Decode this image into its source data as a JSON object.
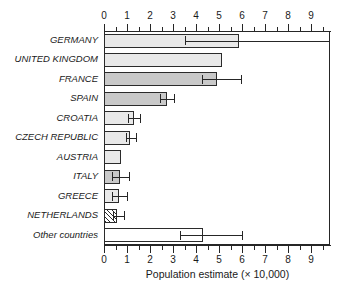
{
  "chart_data": {
    "type": "bar",
    "orientation": "horizontal",
    "title": "",
    "xlabel": "Population estimate (× 10,000)",
    "ylabel": "",
    "xlim": [
      0,
      9.82
    ],
    "xticks": [
      0,
      1,
      2,
      3,
      4,
      5,
      6,
      7,
      8,
      9
    ],
    "xtick_labels": [
      "0",
      "1",
      "2",
      "3",
      "4",
      "5",
      "6",
      "7",
      "8",
      "9"
    ],
    "minor_tick_step": 0.5,
    "grid": false,
    "legend": null,
    "axis_top": true,
    "axis_bottom": true,
    "categories": [
      "GERMANY",
      "UNITED KINGDOM",
      "FRANCE",
      "SPAIN",
      "CROATIA",
      "CZECH REPUBLIC",
      "AUSTRIA",
      "ITALY",
      "GREECE",
      "NETHERLANDS",
      "Other countries"
    ],
    "values": [
      5.85,
      5.15,
      4.9,
      2.75,
      1.3,
      1.15,
      0.75,
      0.7,
      0.65,
      0.55,
      4.3
    ],
    "error_low": [
      3.5,
      null,
      4.25,
      2.45,
      1.05,
      0.95,
      null,
      0.35,
      0.35,
      0.4,
      3.3
    ],
    "error_high": [
      9.82,
      null,
      5.95,
      3.05,
      1.55,
      1.4,
      null,
      1.1,
      1.0,
      0.85,
      6.0
    ],
    "error_high_clipped": [
      true,
      false,
      false,
      false,
      false,
      false,
      false,
      false,
      false,
      false,
      false
    ],
    "fills": [
      "light",
      "light",
      "mid",
      "mid",
      "light",
      "light",
      "light",
      "mid",
      "light",
      "hatch",
      "white"
    ],
    "colors": {
      "fill_light": "#e9e9e9",
      "fill_mid": "#c9c9c9",
      "fill_white": "#ffffff",
      "outline": "#2b2b2b",
      "axis": "#262626",
      "text": "#1a1a1a",
      "background": "#ffffff"
    }
  }
}
